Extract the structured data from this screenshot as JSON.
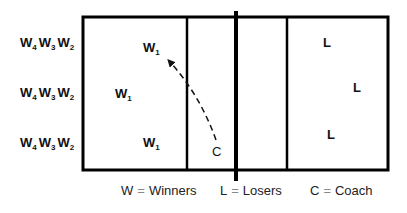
{
  "diagram": {
    "court": {
      "line_color": "#000000",
      "outer": {
        "x": 83,
        "y": 17,
        "width": 305,
        "height": 153
      },
      "net_x": 236,
      "net_extends_top": 11,
      "net_extends_bottom": 181,
      "left_attack_line_x": 187,
      "right_attack_line_x": 287
    },
    "waiting_lines": [
      {
        "label": "W",
        "subs": [
          "4",
          "3",
          "2"
        ],
        "y": 42
      },
      {
        "label": "W",
        "subs": [
          "4",
          "3",
          "2"
        ],
        "y": 92
      },
      {
        "label": "W",
        "subs": [
          "4",
          "3",
          "2"
        ],
        "y": 142
      }
    ],
    "winners": [
      {
        "label": "W",
        "sub": "1",
        "x": 143,
        "y": 47
      },
      {
        "label": "W",
        "sub": "1",
        "x": 115,
        "y": 93
      },
      {
        "label": "W",
        "sub": "1",
        "x": 143,
        "y": 142
      }
    ],
    "losers": [
      {
        "label": "L",
        "x": 326,
        "y": 46
      },
      {
        "label": "L",
        "x": 355,
        "y": 91
      },
      {
        "label": "L",
        "x": 330,
        "y": 136
      }
    ],
    "coach": {
      "label": "C",
      "x": 214,
      "y": 153
    },
    "arrow": {
      "style": "dashed",
      "from": "coach",
      "to": "top winner",
      "description": "Coach tosses ball to W1"
    }
  },
  "legend": [
    {
      "key": "W",
      "eq": "=",
      "value": "Winners"
    },
    {
      "key": "L",
      "eq": "=",
      "value": "Losers"
    },
    {
      "key": "C",
      "eq": "=",
      "value": "Coach"
    }
  ]
}
